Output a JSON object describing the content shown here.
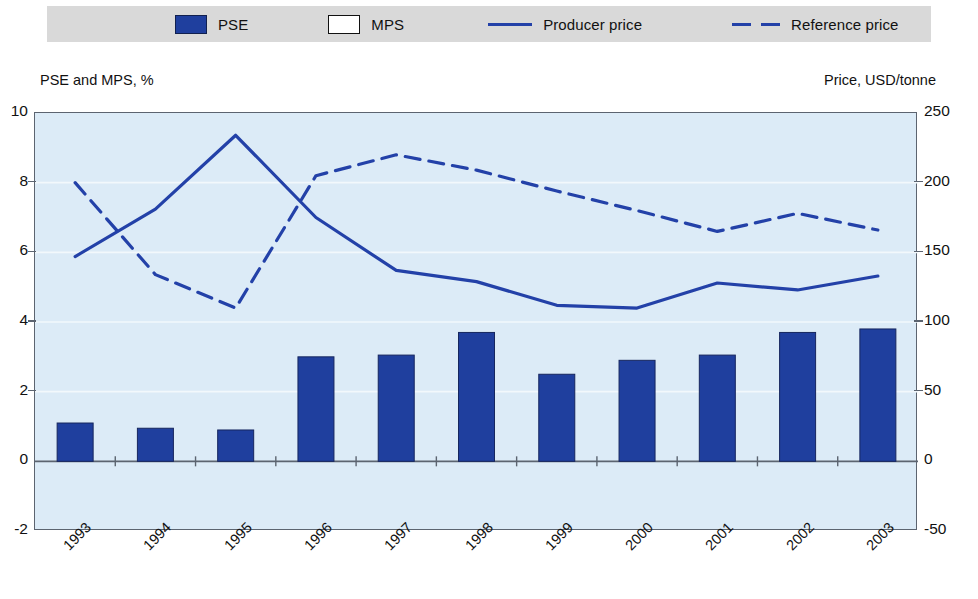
{
  "legend": {
    "items": [
      {
        "label": "PSE",
        "icon": "filled-square-swatch",
        "color": "#1f3f9e"
      },
      {
        "label": "MPS",
        "icon": "empty-square-swatch",
        "color": "#ffffff"
      },
      {
        "label": "Producer price",
        "icon": "solid-line-swatch",
        "color": "#2341a8"
      },
      {
        "label": "Reference price",
        "icon": "dashed-line-swatch",
        "color": "#2341a8"
      }
    ]
  },
  "axis_captions": {
    "left": "PSE and MPS, %",
    "right": "Price, USD/tonne"
  },
  "chart_data": {
    "type": "bar",
    "title": "",
    "xlabel": "",
    "ylabel": "PSE and MPS, %",
    "y2label": "Price, USD/tonne",
    "grid": true,
    "legend_position": "top",
    "categories": [
      "1993",
      "1994",
      "1995",
      "1996",
      "1997",
      "1998",
      "1999",
      "2000",
      "2001",
      "2002",
      "2003"
    ],
    "ylim": [
      -2,
      10
    ],
    "yticks": [
      10,
      8,
      6,
      4,
      2,
      0,
      -2
    ],
    "ytick_labels": [
      "10",
      "8",
      "6",
      "4",
      "2",
      "0",
      "-2"
    ],
    "y2lim": [
      -50,
      250
    ],
    "y2ticks": [
      250,
      200,
      150,
      100,
      50,
      0,
      -50
    ],
    "y2tick_labels": [
      "250",
      "200",
      "150",
      "100",
      "50",
      "0",
      "-50"
    ],
    "series": [
      {
        "name": "PSE",
        "type": "bar",
        "axis": "left",
        "units": "%",
        "color": "#1f3f9e",
        "values": [
          1.1,
          0.95,
          0.9,
          3.0,
          3.05,
          3.7,
          2.5,
          2.9,
          3.05,
          3.7,
          3.8
        ]
      },
      {
        "name": "MPS",
        "type": "bar",
        "axis": "left",
        "units": "%",
        "color": "#ffffff",
        "values": [
          0,
          0,
          0,
          0,
          0,
          0,
          0,
          0,
          0,
          0,
          0
        ]
      },
      {
        "name": "Producer price",
        "type": "line",
        "style": "solid",
        "axis": "right",
        "units": "USD/tonne",
        "color": "#2341a8",
        "values": [
          147,
          181,
          234,
          175,
          137,
          129,
          112,
          110,
          128,
          123,
          133
        ]
      },
      {
        "name": "Reference price",
        "type": "line",
        "style": "dashed",
        "axis": "right",
        "units": "USD/tonne",
        "color": "#2341a8",
        "values": [
          200,
          134,
          110,
          205,
          220,
          209,
          194,
          180,
          165,
          178,
          166
        ]
      }
    ]
  }
}
